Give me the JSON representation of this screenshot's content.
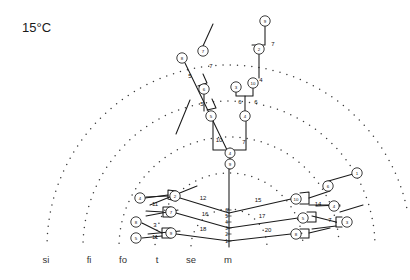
{
  "title": "15°C",
  "axis": {
    "labels": [
      {
        "text": "si",
        "x": 46
      },
      {
        "text": "fi",
        "x": 89
      },
      {
        "text": "fo",
        "x": 123
      },
      {
        "text": "t",
        "x": 157
      },
      {
        "text": "se",
        "x": 191
      },
      {
        "text": "m",
        "x": 228
      }
    ],
    "y": 263
  },
  "trunk_scale": {
    "x": 229,
    "values": [
      "6",
      "5",
      "4",
      "3",
      "2",
      "1"
    ],
    "ys": [
      210,
      216,
      222,
      228,
      234,
      241
    ]
  },
  "arcs": {
    "center_x": 229,
    "center_y": 247,
    "radii": [
      38,
      74,
      110,
      146,
      182
    ],
    "color": "#3a3a3a"
  },
  "nodes": [
    {
      "id": "n1",
      "label": "9",
      "x": 265,
      "y": 21,
      "r": 5.2
    },
    {
      "id": "n2",
      "label": "2",
      "x": 259,
      "y": 49,
      "r": 5.2
    },
    {
      "id": "n3",
      "label": "7",
      "x": 203,
      "y": 51,
      "r": 5.2
    },
    {
      "id": "n4",
      "label": "8",
      "x": 182,
      "y": 58,
      "r": 5.2
    },
    {
      "id": "n5",
      "label": "10",
      "x": 253,
      "y": 83,
      "r": 5.2
    },
    {
      "id": "n6",
      "label": "3",
      "x": 236,
      "y": 87,
      "r": 5.2
    },
    {
      "id": "n7",
      "label": "6",
      "x": 204,
      "y": 89,
      "r": 5.2
    },
    {
      "id": "n8",
      "label": "4",
      "x": 245,
      "y": 116,
      "r": 5.2
    },
    {
      "id": "n9",
      "label": "5",
      "x": 211,
      "y": 116,
      "r": 5.2
    },
    {
      "id": "n10",
      "label": "4",
      "x": 230,
      "y": 153,
      "r": 5.0
    },
    {
      "id": "n11",
      "label": "9",
      "x": 230,
      "y": 164,
      "r": 5.0
    },
    {
      "id": "n12",
      "label": "1",
      "x": 357,
      "y": 173,
      "r": 5.2
    },
    {
      "id": "n13",
      "label": "6",
      "x": 328,
      "y": 186,
      "r": 5.2
    },
    {
      "id": "n14",
      "label": "2",
      "x": 175,
      "y": 196,
      "r": 5.2
    },
    {
      "id": "n15",
      "label": "10",
      "x": 296,
      "y": 199,
      "r": 5.2
    },
    {
      "id": "n16",
      "label": "4",
      "x": 140,
      "y": 198,
      "r": 5.2
    },
    {
      "id": "n17",
      "label": "4",
      "x": 334,
      "y": 206,
      "r": 5.2
    },
    {
      "id": "n18",
      "label": "7",
      "x": 171,
      "y": 212,
      "r": 5.2
    },
    {
      "id": "n19",
      "label": "5",
      "x": 303,
      "y": 218,
      "r": 5.2
    },
    {
      "id": "n20",
      "label": "3",
      "x": 347,
      "y": 222,
      "r": 5.2
    },
    {
      "id": "n21",
      "label": "8",
      "x": 136,
      "y": 222,
      "r": 5.2
    },
    {
      "id": "n22",
      "label": "9",
      "x": 171,
      "y": 233,
      "r": 5.2
    },
    {
      "id": "n23",
      "label": "8",
      "x": 296,
      "y": 234,
      "r": 5.2
    },
    {
      "id": "n24",
      "label": "5",
      "x": 136,
      "y": 238,
      "r": 5.2
    }
  ],
  "edge_labels": [
    {
      "text": "7",
      "x": 273,
      "y": 46
    },
    {
      "text": "7",
      "x": 211,
      "y": 68
    },
    {
      "text": "5",
      "x": 190,
      "y": 78
    },
    {
      "text": "4",
      "x": 261,
      "y": 82
    },
    {
      "text": "6",
      "x": 240,
      "y": 104
    },
    {
      "text": "6",
      "x": 256,
      "y": 104
    },
    {
      "text": "5",
      "x": 202,
      "y": 106
    },
    {
      "text": "10",
      "x": 219,
      "y": 142
    },
    {
      "text": "7",
      "x": 244,
      "y": 144
    },
    {
      "text": "11",
      "x": 155,
      "y": 206
    },
    {
      "text": "12",
      "x": 203,
      "y": 200
    },
    {
      "text": "15",
      "x": 258,
      "y": 202
    },
    {
      "text": "14",
      "x": 318,
      "y": 206
    },
    {
      "text": "16",
      "x": 205,
      "y": 216
    },
    {
      "text": "17",
      "x": 262,
      "y": 218
    },
    {
      "text": "3",
      "x": 155,
      "y": 227
    },
    {
      "text": "7",
      "x": 330,
      "y": 222
    },
    {
      "text": "18",
      "x": 203,
      "y": 231
    },
    {
      "text": "20",
      "x": 268,
      "y": 232
    },
    {
      "text": "11",
      "x": 155,
      "y": 239
    }
  ],
  "branch_paths": [
    {
      "name": "trunk-vertical",
      "d": "M229 247 L229 168"
    },
    {
      "name": "trunk-node-stack",
      "d": "M230 169 L230 148"
    },
    {
      "name": "upper-fork-right",
      "d": "M230 150 L246 150 L246 121"
    },
    {
      "name": "upper-fork-left",
      "d": "M229 150 L213 150 L213 121"
    },
    {
      "name": "mid-right-vertical",
      "d": "M245 111 L245 96 L253 96 L253 88"
    },
    {
      "name": "mid-right-to-n6",
      "d": "M245 96 L236 96 L236 92"
    },
    {
      "name": "mid-left-vertical",
      "d": "M204 111 L204 94"
    },
    {
      "name": "upper-right-vert",
      "d": "M259 78 L259 54"
    },
    {
      "name": "upper-right-top",
      "d": "M259 45 L265 45 L265 26"
    },
    {
      "name": "upper-right-stub",
      "d": "M259 45 L252 45"
    },
    {
      "name": "left-diag-main",
      "d": "M228 152 L185 63"
    },
    {
      "name": "left-diag-seg2",
      "d": "M207 110 L216 108 L212 99"
    },
    {
      "name": "left-diag-seg3",
      "d": "M198 86 L207 83 L203 74"
    },
    {
      "name": "left-diag-upper",
      "d": "M203 46 L213 24"
    },
    {
      "name": "left-diag-tick1",
      "d": "M190 100 L176 134"
    },
    {
      "name": "bl-branch-a",
      "d": "M229 213 L180 198"
    },
    {
      "name": "bl-branch-a-hook",
      "d": "M176 191 L168 190 L168 199 L176 201"
    },
    {
      "name": "bl-branch-a-tail",
      "d": "M168 195 L145 198"
    },
    {
      "name": "bl-branch-a-node",
      "d": "M168 196 L146 197"
    },
    {
      "name": "bl-branch-b",
      "d": "M229 228 L176 213"
    },
    {
      "name": "bl-branch-b-hook",
      "d": "M171 207 L163 207 L163 217 L171 217"
    },
    {
      "name": "bl-branch-b-tail",
      "d": "M163 212 L146 211"
    },
    {
      "name": "bl-branch-c",
      "d": "M229 241 L176 234"
    },
    {
      "name": "bl-branch-c-hook",
      "d": "M171 228 L162 228 L162 238 L171 238"
    },
    {
      "name": "bl-branch-c-tail1",
      "d": "M162 233 L142 223"
    },
    {
      "name": "bl-branch-c-tail2",
      "d": "M162 236 L142 238"
    },
    {
      "name": "bl-diag-stick1",
      "d": "M150 205 L197 186"
    },
    {
      "name": "bl-diag-stick2",
      "d": "M146 216 L178 210"
    },
    {
      "name": "bl-diag-stick3",
      "d": "M148 234 L180 231"
    },
    {
      "name": "br-branch-a",
      "d": "M229 213 L291 199"
    },
    {
      "name": "br-branch-a-hook",
      "d": "M300 193 L309 192 L309 204 L300 204"
    },
    {
      "name": "br-branch-a-tail",
      "d": "M309 198 L330 191"
    },
    {
      "name": "br-branch-a-up",
      "d": "M325 182 L353 174"
    },
    {
      "name": "br-branch-b",
      "d": "M229 228 L298 218"
    },
    {
      "name": "br-branch-b-hook",
      "d": "M307 212 L316 212 L316 222 L307 222"
    },
    {
      "name": "br-branch-b-tail",
      "d": "M316 206 L340 205"
    },
    {
      "name": "br-branch-b-lbl",
      "d": "M309 205 L329 205"
    },
    {
      "name": "br-branch-c",
      "d": "M229 241 L291 234"
    },
    {
      "name": "br-branch-c-hook",
      "d": "M300 229 L309 229 L309 238 L300 238"
    },
    {
      "name": "br-branch-c-tail",
      "d": "M309 233 L330 228"
    },
    {
      "name": "br-far-hook",
      "d": "M342 217 L336 217 L336 227 L342 227"
    },
    {
      "name": "br-far-tail1",
      "d": "M336 222 L312 216"
    },
    {
      "name": "br-far-tail2",
      "d": "M336 226 L312 229"
    },
    {
      "name": "br-far-stick",
      "d": "M340 212 L363 205"
    },
    {
      "name": "br-mid-stick",
      "d": "M329 206 L340 206"
    }
  ]
}
